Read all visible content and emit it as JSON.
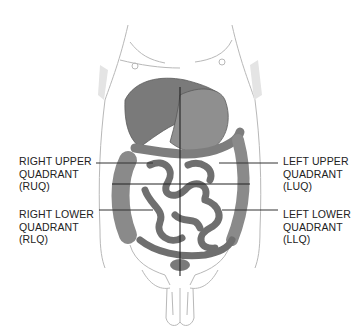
{
  "diagram": {
    "colors": {
      "organ_dark": "#6e6e6e",
      "organ_mid": "#8c8c8c",
      "outline": "#b5b5b5",
      "leader": "#333333"
    },
    "labels": [
      {
        "id": "ruq",
        "line1": "RIGHT UPPER",
        "line2": "QUADRANT",
        "line3": "(RUQ)"
      },
      {
        "id": "rlq",
        "line1": "RIGHT LOWER",
        "line2": "QUADRANT",
        "line3": "(RLQ)"
      },
      {
        "id": "luq",
        "line1": "LEFT UPPER",
        "line2": "QUADRANT",
        "line3": "(LUQ)"
      },
      {
        "id": "llq",
        "line1": "LEFT LOWER",
        "line2": "QUADRANT",
        "line3": "(LLQ)"
      }
    ]
  }
}
